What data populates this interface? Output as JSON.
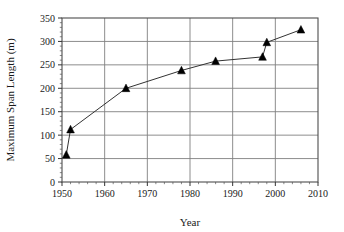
{
  "chart_data": {
    "type": "line",
    "title": "",
    "subtitle": "",
    "xlabel": "Year",
    "ylabel": "Maximum Span Length (m)",
    "xlim": [
      1950,
      2010
    ],
    "ylim": [
      0,
      350
    ],
    "xticks": [
      1950,
      1960,
      1970,
      1980,
      1990,
      2000,
      2010
    ],
    "xtick_labels": [
      "1950",
      "1960",
      "1970",
      "1980",
      "1990",
      "2000",
      "2010"
    ],
    "yticks": [
      0,
      50,
      100,
      150,
      200,
      250,
      300,
      350
    ],
    "ytick_labels": [
      "0",
      "50",
      "100",
      "150",
      "200",
      "250",
      "300",
      "350"
    ],
    "x_minor_tick_step": 2,
    "y_minor_tick_step": 10,
    "grid": true,
    "grid_axes": "both",
    "legend": false,
    "legend_position": "none",
    "marker": "triangle",
    "marker_color": "#000000",
    "line_color": "#333333",
    "grid_color": "#808080",
    "frame_color": "#4d4d4d",
    "background_color": "#ffffff",
    "x": [
      1951,
      1952,
      1965,
      1978,
      1986,
      1997,
      1998,
      2006
    ],
    "y": [
      58,
      112,
      200,
      238,
      258,
      267,
      298,
      325
    ],
    "points": [
      {
        "x": 1951,
        "y": 58
      },
      {
        "x": 1952,
        "y": 112
      },
      {
        "x": 1965,
        "y": 200
      },
      {
        "x": 1978,
        "y": 238
      },
      {
        "x": 1986,
        "y": 258
      },
      {
        "x": 1997,
        "y": 267
      },
      {
        "x": 1998,
        "y": 298
      },
      {
        "x": 2006,
        "y": 325
      }
    ],
    "series": [
      {
        "name": "Maximum Span Length",
        "x": [
          1951,
          1952,
          1965,
          1978,
          1986,
          1997,
          1998,
          2006
        ],
        "values": [
          58,
          112,
          200,
          238,
          258,
          267,
          298,
          325
        ]
      }
    ],
    "annotations": []
  }
}
